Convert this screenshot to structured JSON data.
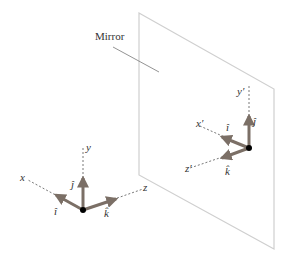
{
  "diagram": {
    "mirror": {
      "label": "Mirror",
      "frame_color": "#cfcfcf",
      "leader_color": "#777777"
    },
    "colors": {
      "arrow": "#7b6f66",
      "axis": "#555555",
      "origin": "#000000",
      "text": "#333333"
    },
    "object_frame": {
      "axes": {
        "x": "x",
        "y": "y",
        "z": "z"
      },
      "unit_vectors": {
        "i": "î",
        "j": "ĵ",
        "k": "k̂"
      }
    },
    "image_frame": {
      "axes": {
        "x": "x′",
        "y": "y′",
        "z": "z′"
      },
      "unit_vectors": {
        "i": "î",
        "j": "ĵ",
        "k": "k̂"
      }
    }
  }
}
